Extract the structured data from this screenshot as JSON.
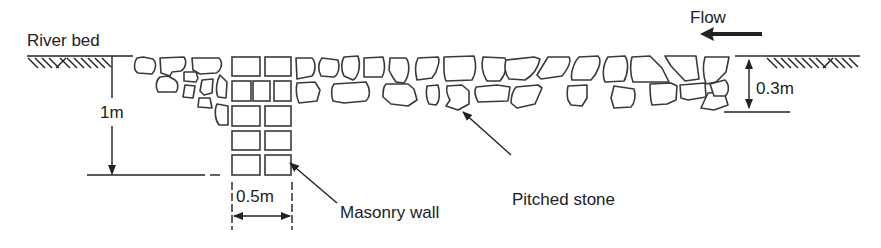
{
  "diagram": {
    "labels": {
      "river_bed": "River bed",
      "flow": "Flow",
      "depth_wall": "1m",
      "wall_width": "0.5m",
      "depth_pitching": "0.3m",
      "masonry_wall": "Masonry wall",
      "pitched_stone": "Pitched stone"
    },
    "colors": {
      "line": "#222222",
      "stone_outline": "#3a3a3a",
      "background": "#ffffff"
    },
    "elements": {
      "flow_direction": "right-to-left",
      "masonry_wall_rows": 5,
      "pitched_stone_layers": 2
    }
  }
}
